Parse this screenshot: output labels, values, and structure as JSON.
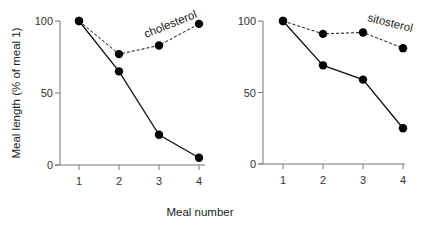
{
  "chart_data": [
    {
      "type": "line",
      "panel": "left",
      "annotation": "cholesterol",
      "categories": [
        1,
        2,
        3,
        4
      ],
      "series": [
        {
          "name": "control (solid)",
          "style": "solid",
          "values": [
            100,
            65,
            21,
            5
          ]
        },
        {
          "name": "cholesterol (dashed)",
          "style": "dashed",
          "values": [
            100,
            77,
            83,
            98
          ]
        }
      ],
      "ylabel": "Meal length (% of meal 1)",
      "xlabel": "Meal number",
      "yticks": [
        0,
        50,
        100
      ],
      "ylim": [
        0,
        100
      ],
      "grid": false
    },
    {
      "type": "line",
      "panel": "right",
      "annotation": "sitosterol",
      "categories": [
        1,
        2,
        3,
        4
      ],
      "series": [
        {
          "name": "control (solid)",
          "style": "solid",
          "values": [
            100,
            69,
            59,
            25
          ]
        },
        {
          "name": "sitosterol (dashed)",
          "style": "dashed",
          "values": [
            100,
            91,
            92,
            81
          ]
        }
      ],
      "xlabel": "Meal number",
      "yticks": [
        0,
        50,
        100
      ],
      "ylim": [
        0,
        100
      ],
      "grid": false
    }
  ],
  "labels": {
    "ylabel": "Meal length (% of meal 1)",
    "xlabel": "Meal number",
    "left_annotation": "cholesterol",
    "right_annotation": "sitosterol",
    "yticks": [
      "0",
      "50",
      "100"
    ],
    "xticks": [
      "1",
      "2",
      "3",
      "4"
    ]
  }
}
